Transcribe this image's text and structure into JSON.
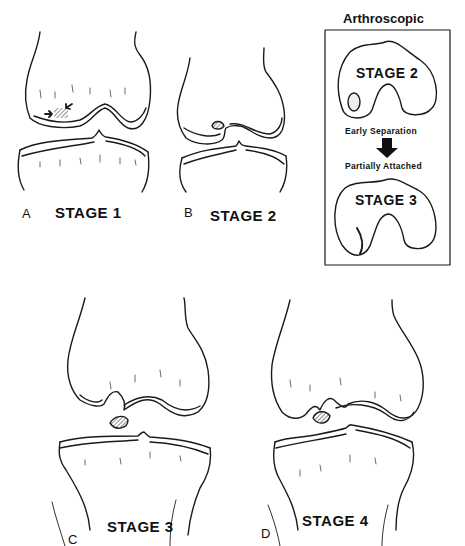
{
  "panels": [
    {
      "letter": "A",
      "stage_label": "STAGE 1"
    },
    {
      "letter": "B",
      "stage_label": "STAGE 2"
    },
    {
      "letter": "C",
      "stage_label": "STAGE 3"
    },
    {
      "letter": "D",
      "stage_label": "STAGE 4"
    }
  ],
  "inset": {
    "title": "Arthroscopic",
    "top_stage": "STAGE 2",
    "top_caption": "Early  Separation",
    "arrow": "down-arrow",
    "bottom_caption": "Partially  Attached",
    "bottom_stage": "STAGE 3"
  },
  "colors": {
    "line": "#1a1a1a",
    "background": "#ffffff"
  }
}
